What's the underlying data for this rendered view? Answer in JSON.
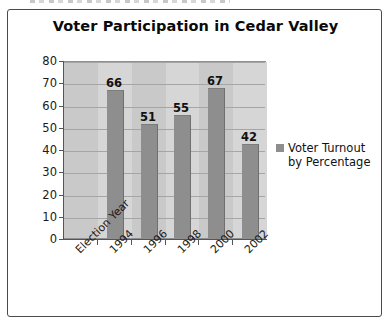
{
  "chart_data": {
    "type": "bar",
    "title": "Voter Participation in Cedar Valley",
    "xlabel": "",
    "ylabel": "",
    "categories": [
      "Election Year",
      "1994",
      "1996",
      "1998",
      "2000",
      "2002"
    ],
    "values": [
      null,
      66,
      51,
      55,
      67,
      42
    ],
    "data_labels": [
      "",
      "66",
      "51",
      "55",
      "67",
      "42"
    ],
    "series": [
      {
        "name": "Voter Turnout by Percentage",
        "values": [
          null,
          66,
          51,
          55,
          67,
          42
        ]
      }
    ],
    "ylim": [
      0,
      80
    ],
    "ytick_labels": [
      "80",
      "70",
      "60",
      "50",
      "40",
      "30",
      "20",
      "10",
      "0"
    ],
    "ytick_values": [
      80,
      70,
      60,
      50,
      40,
      30,
      20,
      10,
      0
    ],
    "grid": true,
    "legend_position": "right",
    "legend_entries": [
      "Voter Turnout by Percentage"
    ],
    "colors": {
      "bar": "#8e8e8e",
      "plot_background": "#c9c9c9",
      "band": "#d6d6d6",
      "gridline": "#a5a5a5",
      "axis": "#555555",
      "text": "#111111",
      "border": "#4a4a4a"
    }
  },
  "legend": {
    "label": "Voter Turnout by Percentage"
  }
}
